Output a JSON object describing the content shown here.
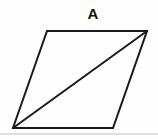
{
  "figure": {
    "label": "A",
    "background_color": "#fefefe",
    "width": 158,
    "height": 139
  },
  "shape": {
    "name": "parallelogram",
    "stroke_color": "#1a1a1a",
    "stroke_width": 2,
    "fill_color": "none",
    "vertices": {
      "top_left": {
        "x": 47,
        "y": 31
      },
      "top_right": {
        "x": 147,
        "y": 31
      },
      "bottom_right": {
        "x": 113,
        "y": 128
      },
      "bottom_left": {
        "x": 13,
        "y": 128
      }
    },
    "outline_points": "47,31 147,31 113,128 13,128",
    "diagonal": {
      "name": "diagonal-bottom-left-to-top-right",
      "from": {
        "x": 13,
        "y": 128
      },
      "to": {
        "x": 147,
        "y": 31
      },
      "stroke_color": "#1a1a1a",
      "stroke_width": 2
    }
  },
  "artifact": {
    "name": "scan-edge-line",
    "color": "#d8d8d8"
  }
}
